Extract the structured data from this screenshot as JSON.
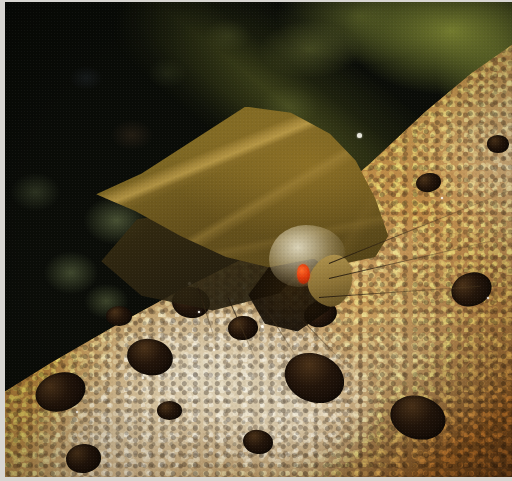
{
  "photo": {
    "subject": "moth",
    "scene_description": "Macro nature photograph of a triangular-winged olive-brown moth perched on mottled tree bark at night, dark blurred green forest foliage behind",
    "orientation": "landscape",
    "width_px": 512,
    "height_px": 481,
    "border": {
      "style": "white photographic print border",
      "color": "#d8d6d2",
      "left_px": 5,
      "top_px": 2,
      "bottom_px": 4,
      "right_px": 0
    },
    "regions": [
      {
        "name": "background-foliage",
        "label": "Dark out-of-focus forest canopy",
        "colors": [
          "#080a06",
          "#0b0d08",
          "#9ea63a",
          "#7a8636"
        ]
      },
      {
        "name": "bark-substrate",
        "label": "Mottled tree bark with pale lichen crust and dark resin blobs",
        "colors": [
          "#6a3f16",
          "#a06a26",
          "#c9a877",
          "#e8e2ce",
          "#23150a"
        ]
      },
      {
        "name": "moth-forewing",
        "label": "Triangular olive-brown forewing with pale golden veins",
        "colors": [
          "#8a7028",
          "#6a5620",
          "#3a2f12",
          "#d0ae56"
        ]
      },
      {
        "name": "moth-head",
        "label": "Tan head with labial palps",
        "colors": [
          "#b79a52",
          "#5c4a20"
        ]
      },
      {
        "name": "moth-eye",
        "label": "Red-orange compound eye",
        "colors": [
          "#ff6b2a",
          "#e23c0c",
          "#9b2406"
        ]
      }
    ],
    "highlights": [
      {
        "name": "wing-apex-droplet",
        "x_pct": 69.5,
        "y_pct": 27.5
      },
      {
        "name": "resin-specular-1",
        "x_pct": 36.0,
        "y_pct": 59.0
      },
      {
        "name": "resin-specular-2",
        "x_pct": 44.5,
        "y_pct": 62.5
      },
      {
        "name": "resin-specular-3",
        "x_pct": 50.5,
        "y_pct": 68.0
      }
    ],
    "accent_color": "#e23c0c"
  }
}
